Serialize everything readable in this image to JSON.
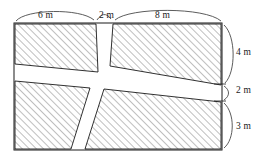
{
  "figure": {
    "units": "m",
    "outer_boundary": {
      "shape": "rectangle",
      "x_left": 14,
      "x_right": 222,
      "y_top": 23,
      "y_bottom": 150
    },
    "stroke_color": "#1a1a1a",
    "hatch_color": "#8a8a8a",
    "fill_color": "#ffffff",
    "brace_color": "#4a4a4a"
  },
  "dimensions": {
    "top": [
      {
        "id": "top-left",
        "label": "6 m",
        "value": 6,
        "unit": "m",
        "spans": "left hatched block width"
      },
      {
        "id": "top-mid",
        "label": "2 m",
        "value": 2,
        "unit": "m",
        "spans": "vertical path width"
      },
      {
        "id": "top-right",
        "label": "8 m",
        "value": 8,
        "unit": "m",
        "spans": "right hatched block width"
      }
    ],
    "right": [
      {
        "id": "right-4m",
        "label": "4 m",
        "value": 4,
        "unit": "m",
        "spans": "upper hatched block height"
      },
      {
        "id": "right-2m",
        "label": "2 m",
        "value": 2,
        "unit": "m",
        "spans": "horizontal path height"
      },
      {
        "id": "right-3m",
        "label": "3 m",
        "value": 3,
        "unit": "m",
        "spans": "lower hatched block height"
      }
    ]
  },
  "regions": [
    {
      "id": "top-left-block",
      "name": "Top left hatched block",
      "hatched": true
    },
    {
      "id": "top-right-block",
      "name": "Top right hatched block",
      "hatched": true
    },
    {
      "id": "bottom-left-block",
      "name": "Bottom left hatched block",
      "hatched": true
    },
    {
      "id": "bottom-right-block",
      "name": "Bottom right hatched block",
      "hatched": true
    },
    {
      "id": "vertical-path",
      "name": "Vertical white path",
      "hatched": false
    },
    {
      "id": "horizontal-path",
      "name": "Horizontal white path",
      "hatched": false
    }
  ]
}
